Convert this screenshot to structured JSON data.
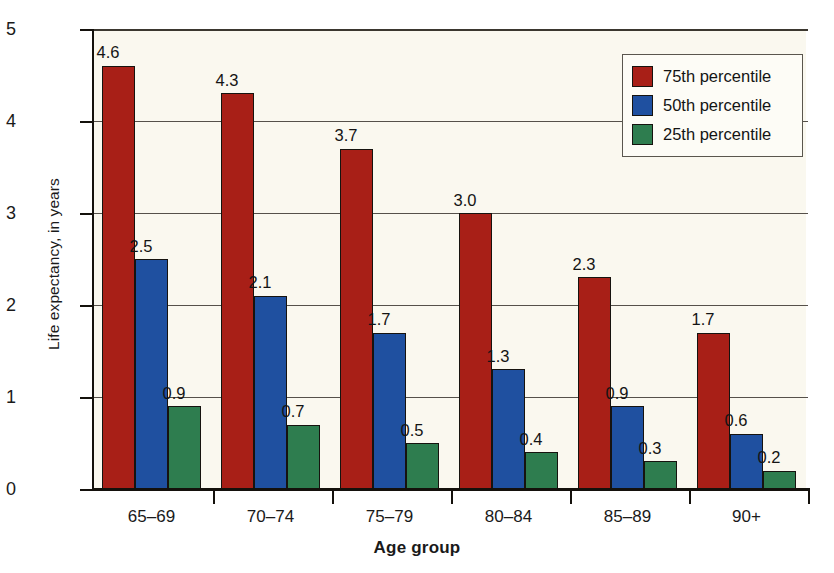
{
  "chart_data": {
    "type": "bar",
    "title": "",
    "xlabel": "Age group",
    "ylabel": "Life expectancy, in years",
    "categories": [
      "65–69",
      "70–74",
      "75–79",
      "80–84",
      "85–89",
      "90+"
    ],
    "series": [
      {
        "name": "75th percentile",
        "color": "#a81f17",
        "values": [
          4.6,
          4.3,
          3.7,
          3.0,
          2.3,
          1.7
        ],
        "labels": [
          "4.6",
          "4.3",
          "3.7",
          "3.0",
          "2.3",
          "1.7"
        ]
      },
      {
        "name": "50th percentile",
        "color": "#1f50a0",
        "values": [
          2.5,
          2.1,
          1.7,
          1.3,
          0.9,
          0.6
        ],
        "labels": [
          "2.5",
          "2.1",
          "1.7",
          "1.3",
          "0.9",
          "0.6"
        ]
      },
      {
        "name": "25th percentile",
        "color": "#2e7d4f",
        "values": [
          0.9,
          0.7,
          0.5,
          0.4,
          0.3,
          0.2
        ],
        "labels": [
          "0.9",
          "0.7",
          "0.5",
          "0.4",
          "0.3",
          "0.2"
        ]
      }
    ],
    "ylim": [
      0,
      5
    ],
    "yticks": [
      0,
      1,
      2,
      3,
      4,
      5
    ],
    "ytick_labels": [
      "0",
      "1",
      "2",
      "3",
      "4",
      "5"
    ],
    "grid": true,
    "legend_position": "top-right",
    "plot_background": "#faf8ef"
  },
  "legend": {
    "entries": [
      {
        "label": "75th percentile",
        "color": "#a81f17"
      },
      {
        "label": "50th percentile",
        "color": "#1f50a0"
      },
      {
        "label": "25th percentile",
        "color": "#2e7d4f"
      }
    ]
  },
  "axes": {
    "y_title": "Life expectancy, in years",
    "x_title": "Age group"
  }
}
